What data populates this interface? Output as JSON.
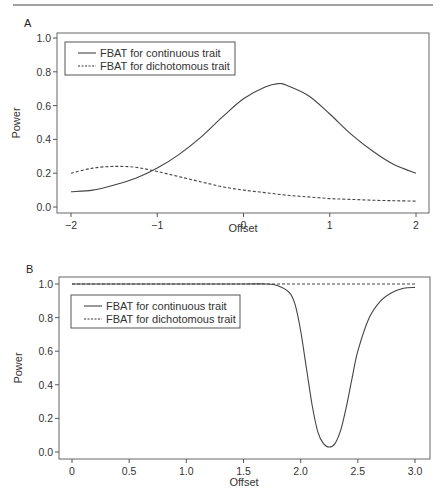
{
  "chart_data": [
    {
      "panel": "A",
      "type": "line",
      "title": "",
      "xlabel": "Offset",
      "ylabel": "Power",
      "xlim": [
        -2,
        2
      ],
      "ylim": [
        0,
        1.0
      ],
      "xticks": [
        "-2",
        "-1",
        "0",
        "1",
        "2"
      ],
      "yticks": [
        "0.0",
        "0.2",
        "0.4",
        "0.6",
        "0.8",
        "1.0"
      ],
      "grid": false,
      "legend_position": "top-left",
      "series": [
        {
          "name": "FBAT for continuous trait",
          "style": "solid",
          "x": [
            -2,
            -1.75,
            -1.5,
            -1.25,
            -1.0,
            -0.75,
            -0.5,
            -0.25,
            0,
            0.25,
            0.4,
            0.5,
            0.75,
            1.0,
            1.25,
            1.5,
            1.75,
            2.0
          ],
          "y": [
            0.09,
            0.1,
            0.13,
            0.17,
            0.23,
            0.31,
            0.41,
            0.53,
            0.64,
            0.71,
            0.73,
            0.72,
            0.66,
            0.55,
            0.43,
            0.33,
            0.25,
            0.2
          ]
        },
        {
          "name": "FBAT for dichotomous trait",
          "style": "dashed",
          "x": [
            -2,
            -1.75,
            -1.5,
            -1.25,
            -1.0,
            -0.75,
            -0.5,
            -0.25,
            0,
            0.25,
            0.5,
            0.75,
            1.0,
            1.25,
            1.5,
            1.75,
            2.0
          ],
          "y": [
            0.2,
            0.23,
            0.24,
            0.235,
            0.21,
            0.18,
            0.15,
            0.12,
            0.1,
            0.085,
            0.07,
            0.06,
            0.05,
            0.045,
            0.04,
            0.037,
            0.035
          ]
        }
      ]
    },
    {
      "panel": "B",
      "type": "line",
      "title": "",
      "xlabel": "Offset",
      "ylabel": "Power",
      "xlim": [
        0,
        3.0
      ],
      "ylim": [
        0,
        1.0
      ],
      "xticks": [
        "0",
        "0.5",
        "1.0",
        "1.5",
        "2.0",
        "2.5",
        "3.0"
      ],
      "yticks": [
        "0.0",
        "0.2",
        "0.4",
        "0.6",
        "0.8",
        "1.0"
      ],
      "grid": false,
      "legend_position": "top-left",
      "series": [
        {
          "name": "FBAT for continuous trait",
          "style": "solid",
          "x": [
            0,
            0.5,
            1.0,
            1.5,
            1.7,
            1.8,
            1.9,
            1.95,
            2.0,
            2.05,
            2.1,
            2.15,
            2.2,
            2.25,
            2.3,
            2.35,
            2.4,
            2.45,
            2.5,
            2.6,
            2.7,
            2.8,
            2.9,
            3.0
          ],
          "y": [
            1.0,
            1.0,
            1.0,
            1.0,
            1.0,
            0.99,
            0.95,
            0.88,
            0.72,
            0.5,
            0.28,
            0.12,
            0.05,
            0.03,
            0.05,
            0.13,
            0.27,
            0.44,
            0.6,
            0.8,
            0.9,
            0.95,
            0.975,
            0.98
          ]
        },
        {
          "name": "FBAT for dichotomous trait",
          "style": "dashed",
          "x": [
            0,
            3.0
          ],
          "y": [
            1.0,
            1.0
          ]
        }
      ]
    }
  ],
  "panels": {
    "A": {
      "label": "A"
    },
    "B": {
      "label": "B"
    }
  },
  "legend": {
    "continuous": "FBAT for continuous trait",
    "dichotomous": "FBAT for dichotomous trait"
  },
  "axes": {
    "xlabel": "Offset",
    "ylabel": "Power"
  }
}
